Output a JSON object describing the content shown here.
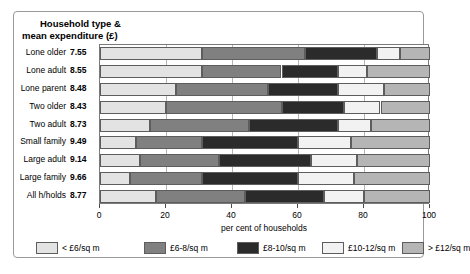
{
  "header": {
    "line1": "Household type &",
    "line2": "mean expenditure (£)"
  },
  "axis": {
    "x_title": "per cent  of households",
    "x_ticks": [
      "0",
      "20",
      "40",
      "60",
      "80",
      "100"
    ]
  },
  "legend": {
    "items": [
      {
        "label": "< £6/sq m",
        "color": "#e3e3e3"
      },
      {
        "label": "£6-8/sq m",
        "color": "#808080"
      },
      {
        "label": "£8-10/sq m",
        "color": "#2b2b2b"
      },
      {
        "label": "£10-12/sq m",
        "color": "#f2f2f2"
      },
      {
        "label": "> £12/sq m",
        "color": "#b5b5b5"
      }
    ]
  },
  "rows": [
    {
      "name": "Lone older",
      "value": "7.55"
    },
    {
      "name": "Lone adult",
      "value": "8.55"
    },
    {
      "name": "Lone parent",
      "value": "8.48"
    },
    {
      "name": "Two older",
      "value": "8.43"
    },
    {
      "name": "Two adult",
      "value": "8.73"
    },
    {
      "name": "Small family",
      "value": "9.49"
    },
    {
      "name": "Large adult",
      "value": "9.14"
    },
    {
      "name": "Large family",
      "value": "9.66"
    },
    {
      "name": "All h/holds",
      "value": "8.77"
    }
  ],
  "chart_data": {
    "type": "bar",
    "orientation": "horizontal",
    "stacked": true,
    "stacked_percent": true,
    "title": "Household type & mean expenditure (£)",
    "xlabel": "per cent  of households",
    "ylabel": "",
    "xlim": [
      0,
      100
    ],
    "xticks": [
      0,
      20,
      40,
      60,
      80,
      100
    ],
    "grid": true,
    "legend_position": "bottom",
    "categories": [
      "Lone older",
      "Lone adult",
      "Lone parent",
      "Two older",
      "Two adult",
      "Small family",
      "Large adult",
      "Large family",
      "All h/holds"
    ],
    "category_values": [
      7.55,
      8.55,
      8.48,
      8.43,
      8.73,
      9.49,
      9.14,
      9.66,
      8.77
    ],
    "category_value_label": "mean expenditure (£)",
    "series": [
      {
        "name": "< £6/sq m",
        "color": "#e3e3e3",
        "values": [
          31,
          31,
          23,
          20,
          15,
          11,
          12,
          9,
          17
        ]
      },
      {
        "name": "£6-8/sq m",
        "color": "#808080",
        "values": [
          31,
          24,
          28,
          35,
          30,
          20,
          24,
          22,
          27
        ]
      },
      {
        "name": "£8-10/sq m",
        "color": "#2b2b2b",
        "values": [
          22,
          17,
          21,
          19,
          27,
          29,
          28,
          29,
          24
        ]
      },
      {
        "name": "£10-12/sq m",
        "color": "#f2f2f2",
        "values": [
          7,
          9,
          14,
          11,
          10,
          16,
          14,
          17,
          12
        ]
      },
      {
        "name": "> £12/sq m",
        "color": "#b5b5b5",
        "values": [
          9,
          19,
          14,
          15,
          18,
          24,
          22,
          23,
          20
        ]
      }
    ]
  }
}
